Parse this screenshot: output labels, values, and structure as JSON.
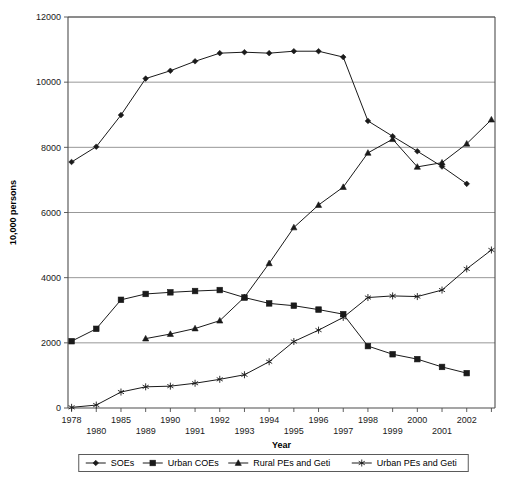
{
  "chart_data": {
    "type": "line",
    "title": "",
    "xlabel": "Year",
    "ylabel": "10,000 persons",
    "ylim": [
      0,
      12000
    ],
    "yticks": [
      0,
      2000,
      4000,
      6000,
      8000,
      10000,
      12000
    ],
    "ytick_labels": [
      "0",
      "2000",
      "4000",
      "6000",
      "8000",
      "10000",
      "12000"
    ],
    "grid": "horizontal",
    "legend_position": "bottom",
    "x": [
      1978,
      1980,
      1985,
      1989,
      1990,
      1991,
      1992,
      1993,
      1994,
      1995,
      1996,
      1997,
      1998,
      1999,
      2000,
      2001,
      2002,
      2003
    ],
    "xtick_labels": [
      "1978",
      "1980",
      "1985",
      "1989",
      "1990",
      "1991",
      "1992",
      "1993",
      "1994",
      "1995",
      "1996",
      "1997",
      "1998",
      "1999",
      "2000",
      "2001",
      "2002",
      ""
    ],
    "xtick_rows": [
      0,
      1,
      0,
      1,
      0,
      1,
      0,
      1,
      0,
      1,
      0,
      1,
      0,
      1,
      0,
      1,
      0,
      0
    ],
    "series": [
      {
        "name": "SOEs",
        "marker": "diamond",
        "values": [
          7550,
          8020,
          8990,
          10110,
          10350,
          10640,
          10890,
          10920,
          10890,
          10950,
          10950,
          10770,
          8810,
          8340,
          7880,
          7410,
          6880,
          null
        ]
      },
      {
        "name": "Urban COEs",
        "marker": "square",
        "values": [
          2050,
          2430,
          3320,
          3500,
          3550,
          3590,
          3620,
          3390,
          3210,
          3140,
          3020,
          2880,
          1900,
          1650,
          1500,
          1260,
          1070,
          null
        ]
      },
      {
        "name": "Rural PEs and Geti",
        "marker": "triangle",
        "values": [
          null,
          null,
          null,
          2130,
          2270,
          2440,
          2680,
          3400,
          4440,
          5540,
          6230,
          6780,
          7830,
          8250,
          7400,
          7530,
          8110,
          8850
        ]
      },
      {
        "name": "Urban PEs and Geti",
        "marker": "star",
        "values": [
          20,
          90,
          490,
          650,
          670,
          760,
          880,
          1020,
          1420,
          2040,
          2390,
          2780,
          3390,
          3440,
          3420,
          3620,
          4270,
          4850
        ]
      }
    ]
  },
  "legend": {
    "items": [
      {
        "label": "SOEs",
        "marker": "diamond"
      },
      {
        "label": "Urban COEs",
        "marker": "square"
      },
      {
        "label": "Rural PEs and Geti",
        "marker": "triangle"
      },
      {
        "label": "Urban PEs and Geti",
        "marker": "star"
      }
    ]
  },
  "colors": {
    "line": "#1a1a1a",
    "grid": "#8c8c8c",
    "axis": "#4d4d4d",
    "background": "#ffffff"
  }
}
